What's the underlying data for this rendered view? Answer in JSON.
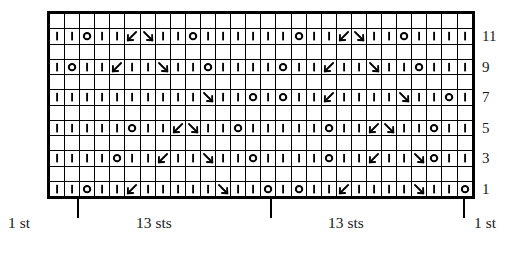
{
  "chart_data": {
    "type": "table",
    "columns": 28,
    "rows": 12,
    "xlabel": "stitches",
    "ylabel": "rows",
    "grid": true,
    "symbol_legend": {
      "knit": "|",
      "yarn-over": "O",
      "ssk-left-slant": "\\",
      "k2tog-right-slant": "/",
      "blank": ""
    },
    "row_numbers": [
      "11",
      "9",
      "7",
      "5",
      "3",
      "1"
    ],
    "row_bands": [
      {
        "label": "",
        "numbered": false,
        "cells": [
          "",
          "",
          "",
          "",
          "",
          "",
          "",
          "",
          "",
          "",
          "",
          "",
          "",
          "",
          "",
          "",
          "",
          "",
          "",
          "",
          "",
          "",
          "",
          "",
          "",
          "",
          "",
          ""
        ]
      },
      {
        "label": "11",
        "numbered": true,
        "cells": [
          "knit",
          "knit",
          "yo",
          "knit",
          "knit",
          "ssk",
          "k2tog",
          "knit",
          "knit",
          "yo",
          "knit",
          "knit",
          "knit",
          "knit",
          "knit",
          "knit",
          "yo",
          "knit",
          "knit",
          "ssk",
          "k2tog",
          "knit",
          "knit",
          "yo",
          "knit",
          "knit",
          "knit",
          "knit"
        ]
      },
      {
        "label": "",
        "numbered": false,
        "cells": [
          "",
          "",
          "",
          "",
          "",
          "",
          "",
          "",
          "",
          "",
          "",
          "",
          "",
          "",
          "",
          "",
          "",
          "",
          "",
          "",
          "",
          "",
          "",
          "",
          "",
          "",
          "",
          ""
        ]
      },
      {
        "label": "9",
        "numbered": true,
        "cells": [
          "knit",
          "yo",
          "knit",
          "knit",
          "ssk",
          "knit",
          "knit",
          "k2tog",
          "knit",
          "knit",
          "yo",
          "knit",
          "knit",
          "knit",
          "knit",
          "yo",
          "knit",
          "knit",
          "ssk",
          "knit",
          "knit",
          "k2tog",
          "knit",
          "knit",
          "yo",
          "knit",
          "knit",
          "knit"
        ]
      },
      {
        "label": "",
        "numbered": false,
        "cells": [
          "",
          "",
          "",
          "",
          "",
          "",
          "",
          "",
          "",
          "",
          "",
          "",
          "",
          "",
          "",
          "",
          "",
          "",
          "",
          "",
          "",
          "",
          "",
          "",
          "",
          "",
          "",
          ""
        ]
      },
      {
        "label": "7",
        "numbered": true,
        "cells": [
          "knit",
          "knit",
          "knit",
          "knit",
          "knit",
          "knit",
          "knit",
          "knit",
          "knit",
          "knit",
          "k2tog",
          "knit",
          "knit",
          "yo",
          "knit",
          "yo",
          "knit",
          "knit",
          "ssk",
          "knit",
          "knit",
          "knit",
          "knit",
          "k2tog",
          "knit",
          "knit",
          "yo",
          "knit"
        ]
      },
      {
        "label": "",
        "numbered": false,
        "cells": [
          "",
          "",
          "",
          "",
          "",
          "",
          "",
          "",
          "",
          "",
          "",
          "",
          "",
          "",
          "",
          "",
          "",
          "",
          "",
          "",
          "",
          "",
          "",
          "",
          "",
          "",
          "",
          ""
        ]
      },
      {
        "label": "5",
        "numbered": true,
        "cells": [
          "knit",
          "knit",
          "knit",
          "knit",
          "knit",
          "yo",
          "knit",
          "knit",
          "ssk",
          "k2tog",
          "knit",
          "knit",
          "yo",
          "knit",
          "knit",
          "knit",
          "knit",
          "knit",
          "yo",
          "knit",
          "knit",
          "ssk",
          "k2tog",
          "knit",
          "knit",
          "yo",
          "knit",
          "knit"
        ]
      },
      {
        "label": "",
        "numbered": false,
        "cells": [
          "",
          "",
          "",
          "",
          "",
          "",
          "",
          "",
          "",
          "",
          "",
          "",
          "",
          "",
          "",
          "",
          "",
          "",
          "",
          "",
          "",
          "",
          "",
          "",
          "",
          "",
          "",
          ""
        ]
      },
      {
        "label": "3",
        "numbered": true,
        "cells": [
          "knit",
          "knit",
          "knit",
          "knit",
          "yo",
          "knit",
          "knit",
          "ssk",
          "knit",
          "knit",
          "k2tog",
          "knit",
          "knit",
          "yo",
          "knit",
          "knit",
          "knit",
          "knit",
          "yo",
          "knit",
          "knit",
          "ssk",
          "knit",
          "knit",
          "k2tog",
          "yo",
          "knit",
          "knit"
        ]
      },
      {
        "label": "",
        "numbered": false,
        "cells": [
          "",
          "",
          "",
          "",
          "",
          "",
          "",
          "",
          "",
          "",
          "",
          "",
          "",
          "",
          "",
          "",
          "",
          "",
          "",
          "",
          "",
          "",
          "",
          "",
          "",
          "",
          "",
          ""
        ]
      },
      {
        "label": "1",
        "numbered": true,
        "cells": [
          "knit",
          "knit",
          "yo",
          "knit",
          "knit",
          "ssk",
          "knit",
          "knit",
          "knit",
          "knit",
          "knit",
          "k2tog",
          "knit",
          "knit",
          "yo",
          "knit",
          "yo",
          "knit",
          "knit",
          "ssk",
          "knit",
          "knit",
          "knit",
          "knit",
          "k2tog",
          "knit",
          "knit",
          "yo"
        ]
      }
    ]
  },
  "axis": {
    "left_label": "1 st",
    "right_label": "1 st",
    "repeat_label_left": "13 sts",
    "repeat_label_right": "13 sts"
  },
  "colors": {
    "ink": "#000000",
    "paper": "#ffffff",
    "text": "#1a1a1a"
  }
}
